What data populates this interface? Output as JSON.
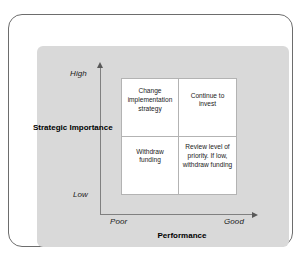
{
  "figure": {
    "frame_color": "#6d6d6d",
    "panel_color": "#d9d9d9",
    "axis_color": "#808080",
    "matrix_border_color": "#b3b3b3",
    "cell_background": "#ffffff"
  },
  "chart_data": {
    "type": "heatmap",
    "title": "",
    "xlabel": "Performance",
    "ylabel": "Strategic Importance",
    "x_tick_labels": [
      "Poor",
      "Good"
    ],
    "y_tick_labels": [
      "Low",
      "High"
    ],
    "grid": false,
    "legend": "none",
    "categories_x": [
      "Poor",
      "Good"
    ],
    "categories_y": [
      "High",
      "Low"
    ],
    "cells": [
      {
        "row": "High",
        "column": "Poor",
        "position": "top-left",
        "text": "Change implementation strategy"
      },
      {
        "row": "High",
        "column": "Good",
        "position": "top-right",
        "text": "Continue to invest"
      },
      {
        "row": "Low",
        "column": "Poor",
        "position": "bottom-left",
        "text": "Withdraw funding"
      },
      {
        "row": "Low",
        "column": "Good",
        "position": "bottom-right",
        "text": "Review level of priority. If low, withdraw funding"
      }
    ]
  },
  "axes": {
    "y": {
      "title": "Strategic Importance",
      "high_label": "High",
      "low_label": "Low"
    },
    "x": {
      "title": "Performance",
      "low_label": "Poor",
      "high_label": "Good"
    }
  }
}
